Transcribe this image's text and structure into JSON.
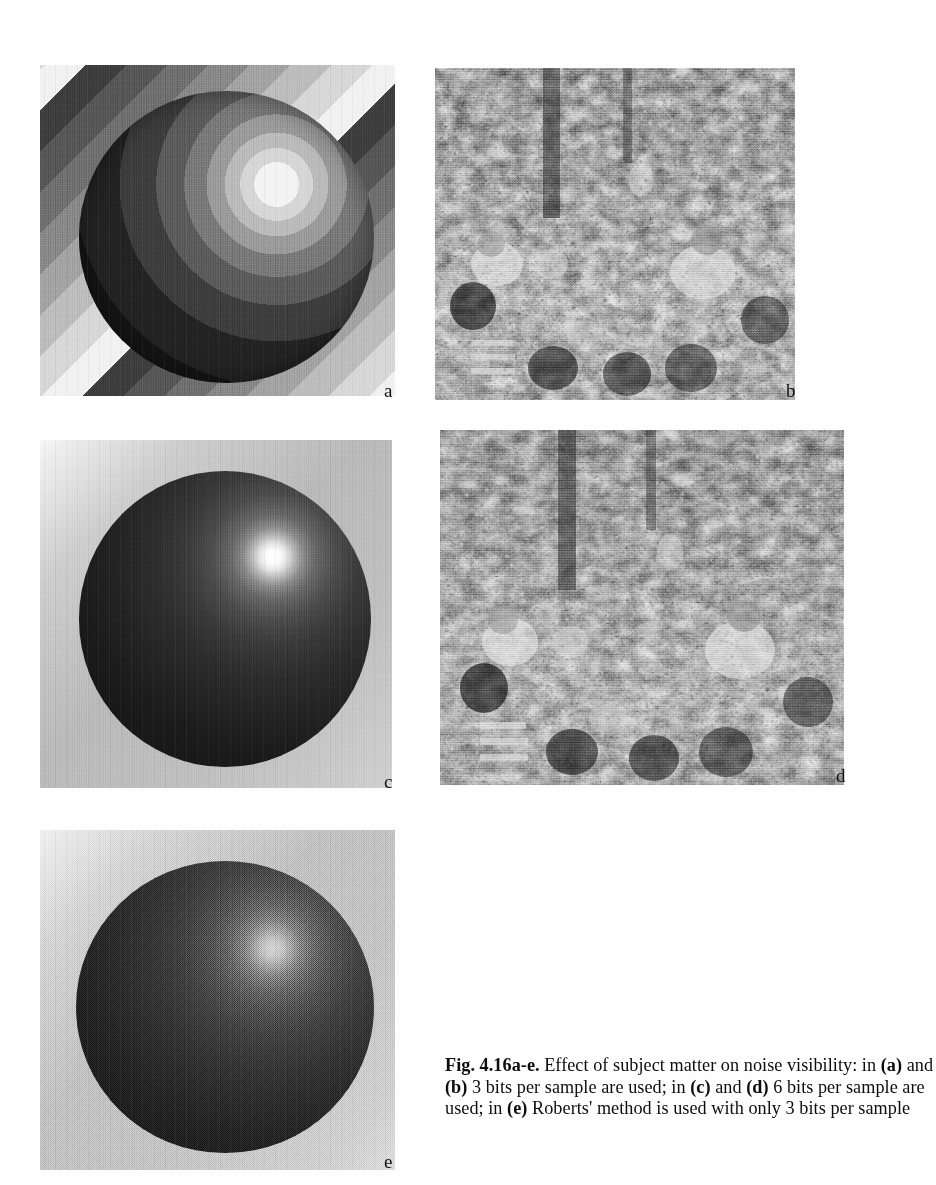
{
  "figure": {
    "id": "Fig. 4.16a-e",
    "caption_label": "Fig. 4.16a-e.",
    "caption_segments": [
      {
        "text": "Fig. 4.16a-e.",
        "bold": true
      },
      {
        "text": " Effect of subject matter on noise visibility: in ",
        "bold": false
      },
      {
        "text": "(a)",
        "bold": true
      },
      {
        "text": " and ",
        "bold": false
      },
      {
        "text": "(b)",
        "bold": true
      },
      {
        "text": " 3 bits per sample are used; in ",
        "bold": false
      },
      {
        "text": "(c)",
        "bold": true
      },
      {
        "text": " and ",
        "bold": false
      },
      {
        "text": "(d)",
        "bold": true
      },
      {
        "text": " 6 bits per sample are used; in ",
        "bold": false
      },
      {
        "text": "(e)",
        "bold": true
      },
      {
        "text": " Roberts' method is used with only 3 bits per sample",
        "bold": false
      }
    ],
    "caption_plain": "Fig. 4.16a-e. Effect of subject matter on noise visibility: in (a) and (b) 3 bits per sample are used; in (c) and (d) 6 bits per sample are used; in (e) Roberts' method is used with only 3 bits per sample",
    "caption_lines": [
      "Fig. 4.16a-e. Effect of subject matter on noise visibility:",
      "in (a) and (b) 3 bits per sample are used; in (c) and (d) 6",
      "bits per sample are used; in (e) Roberts' method is used",
      "with only 3 bits per sample"
    ]
  },
  "panels": [
    {
      "key": "a",
      "label": "a",
      "subject": "shaded sphere on diagonally striped background",
      "quantization": "3 bits per sample",
      "artifact": "contouring / false contours"
    },
    {
      "key": "b",
      "label": "b",
      "subject": "outdoor crowd of seated people photograph",
      "quantization": "3 bits per sample",
      "artifact": "contouring masked by detail"
    },
    {
      "key": "c",
      "label": "c",
      "subject": "shaded sphere with specular highlight on gradient background",
      "quantization": "6 bits per sample",
      "artifact": "smooth, no visible contouring"
    },
    {
      "key": "d",
      "label": "d",
      "subject": "outdoor crowd of seated people photograph",
      "quantization": "6 bits per sample",
      "artifact": "smooth, no visible contouring"
    },
    {
      "key": "e",
      "label": "e",
      "subject": "shaded sphere on gradient background",
      "quantization": "3 bits per sample",
      "artifact": "Roberts' pseudo-random noise dithering"
    }
  ],
  "colors": {
    "page_background": "#ffffff",
    "text": "#0d0d0d",
    "ink_dark": "#141414",
    "ink_light": "#f4f4f4"
  }
}
